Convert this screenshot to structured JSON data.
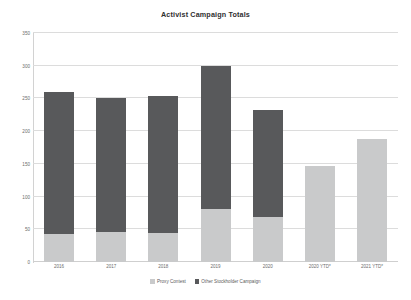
{
  "chart_data": {
    "type": "bar",
    "subtype": "stacked-bar",
    "title": "Activist Campaign Totals",
    "xlabel": "",
    "ylabel": "",
    "categories": [
      "2016",
      "2017",
      "2018",
      "2019",
      "2020",
      "2020 YTD*",
      "2021 YTD*"
    ],
    "series": [
      {
        "name": "Proxy Contest",
        "color": "#c9cacb",
        "values": [
          43,
          46,
          44,
          81,
          69,
          147,
          188
        ]
      },
      {
        "name": "Other Stockholder Campaign",
        "color": "#58595b",
        "values": [
          217,
          204,
          210,
          219,
          163,
          0,
          0
        ]
      }
    ],
    "totals": [
      260,
      250,
      254,
      300,
      232,
      147,
      188
    ],
    "ylim": [
      0,
      350
    ],
    "yticks": [
      0,
      50,
      100,
      150,
      200,
      250,
      300,
      350
    ],
    "ytick_labels": [
      "0",
      "50",
      "100",
      "150",
      "200",
      "250",
      "300",
      "350"
    ],
    "grid": true,
    "legend_position": "bottom"
  },
  "legend": {
    "items": [
      {
        "label": "Proxy Contest",
        "color": "#c9cacb"
      },
      {
        "label": "Other Stockholder Campaign",
        "color": "#58595b"
      }
    ]
  }
}
